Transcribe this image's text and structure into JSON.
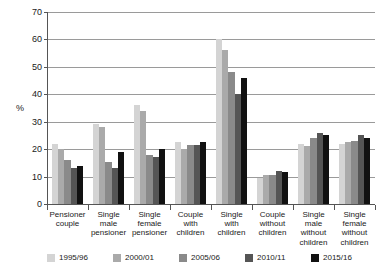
{
  "chart_data": {
    "type": "bar",
    "title": "",
    "subtitle": "",
    "xlabel": "",
    "ylabel": "%",
    "ylim": [
      0,
      70
    ],
    "yticks": [
      0,
      10,
      20,
      30,
      40,
      50,
      60,
      70
    ],
    "grid": true,
    "legend_position": "bottom",
    "orientation": "vertical",
    "grouping": "clustered",
    "categories": [
      "Pensioner couple",
      "Single male pensioner",
      "Single female pensioner",
      "Couple with children",
      "Single with children",
      "Couple without children",
      "Single male without children",
      "Single female without children"
    ],
    "category_lines": [
      [
        "Pensioner",
        "couple"
      ],
      [
        "Single",
        "male",
        "pensioner"
      ],
      [
        "Single",
        "female",
        "pensioner"
      ],
      [
        "Couple",
        "with",
        "children"
      ],
      [
        "Single",
        "with",
        "children"
      ],
      [
        "Couple",
        "without",
        "children"
      ],
      [
        "Single",
        "male",
        "without",
        "children"
      ],
      [
        "Single",
        "female",
        "without",
        "children"
      ]
    ],
    "series": [
      {
        "name": "1995/96",
        "color": "#d4d4d4",
        "values": [
          22,
          29,
          36,
          22.5,
          60,
          9.5,
          22,
          22
        ]
      },
      {
        "name": "2000/01",
        "color": "#aaaaaa",
        "values": [
          20,
          28,
          34,
          20,
          56,
          10.5,
          21,
          22.5
        ]
      },
      {
        "name": "2005/06",
        "color": "#8a8a8a",
        "values": [
          16,
          15.5,
          18,
          21.5,
          48,
          10.5,
          24,
          23
        ]
      },
      {
        "name": "2010/11",
        "color": "#555555",
        "values": [
          13,
          13,
          17,
          21.5,
          40,
          12,
          26,
          25
        ]
      },
      {
        "name": "2015/16",
        "color": "#111111",
        "values": [
          14,
          19,
          20,
          22.5,
          46,
          11.5,
          25,
          24
        ]
      }
    ]
  }
}
